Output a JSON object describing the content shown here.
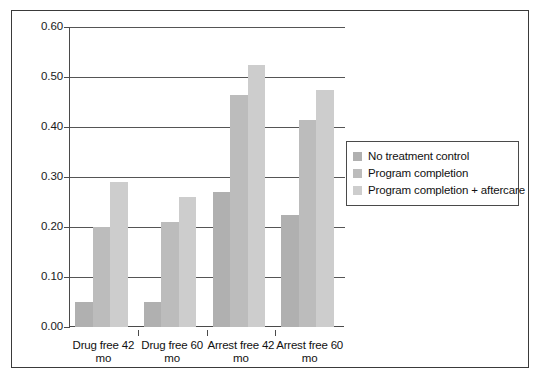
{
  "chart_data": {
    "type": "bar",
    "title": "",
    "subtitle": "",
    "xlabel": "",
    "ylabel": "",
    "categories": [
      "Drug free 42 mo",
      "Drug free 60 mo",
      "Arrest free 42 mo",
      "Arrest free 60 mo"
    ],
    "category_lines": [
      [
        "Drug free 42",
        "mo"
      ],
      [
        "Drug free 60",
        "mo"
      ],
      [
        "Arrest free 42",
        "mo"
      ],
      [
        "Arrest free 60",
        "mo"
      ]
    ],
    "series": [
      {
        "name": "No treatment control",
        "color": "#b0b0b0",
        "values": [
          0.05,
          0.05,
          0.27,
          0.225
        ]
      },
      {
        "name": "Program completion",
        "color": "#bcbcbc",
        "values": [
          0.2,
          0.21,
          0.465,
          0.415
        ]
      },
      {
        "name": "Program completion + aftercare",
        "color": "#cdcdcd",
        "values": [
          0.29,
          0.26,
          0.525,
          0.475
        ]
      }
    ],
    "ylim": [
      0.0,
      0.6
    ],
    "ytick_values": [
      0.6,
      0.5,
      0.4,
      0.3,
      0.2,
      0.1,
      0.0
    ],
    "ytick_labels": [
      "0.60",
      "0.50",
      "0.40",
      "0.30",
      "0.20",
      "0.10",
      "0.00"
    ],
    "grid": true,
    "grid_axis": "y",
    "legend_position": "right",
    "frame_color": "#3a3a3a",
    "axis_color": "#4a4a4a",
    "grid_color": "#555555",
    "background": "#ffffff"
  },
  "legend": {
    "items": [
      {
        "label": "No treatment control",
        "color": "#b0b0b0"
      },
      {
        "label": "Program completion",
        "color": "#bcbcbc"
      },
      {
        "label": "Program completion + aftercare",
        "color": "#cdcdcd"
      }
    ]
  }
}
